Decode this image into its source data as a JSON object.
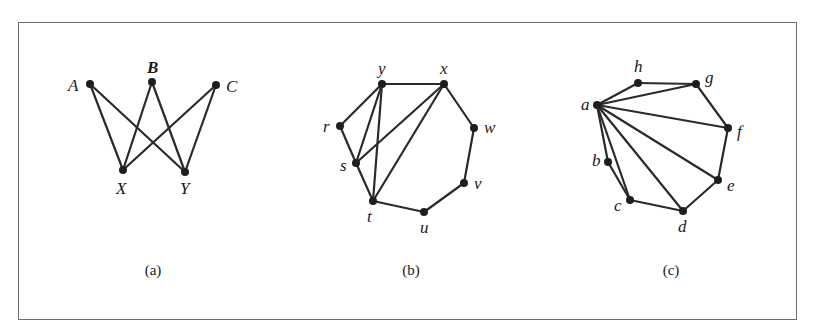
{
  "figure": {
    "frame": {
      "border_color": "#6e6e6e",
      "background": "#ffffff"
    },
    "panels": [
      {
        "id": "a",
        "caption": "(a)",
        "caption_pos": [
          153,
          275
        ],
        "vertices": [
          {
            "id": "A",
            "label": "A",
            "x": 90,
            "y": 84,
            "lx": 68,
            "ly": 91,
            "bold": false
          },
          {
            "id": "B",
            "label": "B",
            "x": 152,
            "y": 82,
            "lx": 147,
            "ly": 73,
            "bold": true
          },
          {
            "id": "C",
            "label": "C",
            "x": 216,
            "y": 85,
            "lx": 226,
            "ly": 92,
            "bold": false
          },
          {
            "id": "X",
            "label": "X",
            "x": 123,
            "y": 170,
            "lx": 116,
            "ly": 194,
            "bold": false
          },
          {
            "id": "Y",
            "label": "Y",
            "x": 185,
            "y": 172,
            "lx": 180,
            "ly": 194,
            "bold": false
          }
        ],
        "edges": [
          [
            "A",
            "X"
          ],
          [
            "A",
            "Y"
          ],
          [
            "B",
            "X"
          ],
          [
            "B",
            "Y"
          ],
          [
            "C",
            "X"
          ],
          [
            "C",
            "Y"
          ]
        ]
      },
      {
        "id": "b",
        "caption": "(b)",
        "caption_pos": [
          411,
          275
        ],
        "vertices": [
          {
            "id": "y",
            "label": "y",
            "x": 382,
            "y": 84,
            "lx": 378,
            "ly": 74
          },
          {
            "id": "x",
            "label": "x",
            "x": 444,
            "y": 84,
            "lx": 440,
            "ly": 74
          },
          {
            "id": "w",
            "label": "w",
            "x": 474,
            "y": 128,
            "lx": 484,
            "ly": 133
          },
          {
            "id": "v",
            "label": "v",
            "x": 464,
            "y": 183,
            "lx": 474,
            "ly": 189
          },
          {
            "id": "u",
            "label": "u",
            "x": 424,
            "y": 212,
            "lx": 420,
            "ly": 233
          },
          {
            "id": "t",
            "label": "t",
            "x": 373,
            "y": 201,
            "lx": 367,
            "ly": 222
          },
          {
            "id": "s",
            "label": "s",
            "x": 356,
            "y": 163,
            "lx": 340,
            "ly": 171
          },
          {
            "id": "r",
            "label": "r",
            "x": 340,
            "y": 126,
            "lx": 323,
            "ly": 132
          }
        ],
        "edges": [
          [
            "y",
            "x"
          ],
          [
            "x",
            "w"
          ],
          [
            "w",
            "v"
          ],
          [
            "v",
            "u"
          ],
          [
            "u",
            "t"
          ],
          [
            "t",
            "s"
          ],
          [
            "s",
            "r"
          ],
          [
            "r",
            "y"
          ],
          [
            "y",
            "s"
          ],
          [
            "y",
            "t"
          ],
          [
            "s",
            "x"
          ],
          [
            "t",
            "x"
          ]
        ]
      },
      {
        "id": "c",
        "caption": "(c)",
        "caption_pos": [
          671,
          275
        ],
        "vertices": [
          {
            "id": "a",
            "label": "a",
            "x": 597,
            "y": 105,
            "lx": 581,
            "ly": 110
          },
          {
            "id": "h",
            "label": "h",
            "x": 638,
            "y": 83,
            "lx": 634,
            "ly": 72
          },
          {
            "id": "g",
            "label": "g",
            "x": 696,
            "y": 84,
            "lx": 705,
            "ly": 83
          },
          {
            "id": "f",
            "label": "f",
            "x": 728,
            "y": 128,
            "lx": 737,
            "ly": 137
          },
          {
            "id": "e",
            "label": "e",
            "x": 718,
            "y": 180,
            "lx": 727,
            "ly": 191
          },
          {
            "id": "d",
            "label": "d",
            "x": 683,
            "y": 211,
            "lx": 678,
            "ly": 232
          },
          {
            "id": "c",
            "label": "c",
            "x": 630,
            "y": 200,
            "lx": 614,
            "ly": 211
          },
          {
            "id": "b",
            "label": "b",
            "x": 608,
            "y": 162,
            "lx": 592,
            "ly": 166
          }
        ],
        "edges": [
          [
            "a",
            "h"
          ],
          [
            "h",
            "g"
          ],
          [
            "g",
            "f"
          ],
          [
            "f",
            "e"
          ],
          [
            "e",
            "d"
          ],
          [
            "d",
            "c"
          ],
          [
            "c",
            "b"
          ],
          [
            "b",
            "a"
          ],
          [
            "a",
            "g"
          ],
          [
            "a",
            "f"
          ],
          [
            "a",
            "e"
          ],
          [
            "a",
            "d"
          ],
          [
            "a",
            "c"
          ]
        ]
      }
    ]
  }
}
